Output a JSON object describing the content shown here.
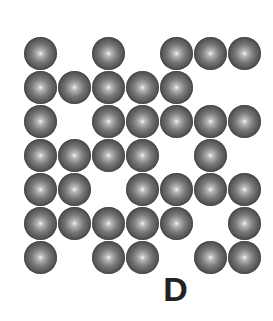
{
  "figure": {
    "label": "D",
    "rows": 7,
    "cols": 7,
    "ball_color": "#4a4a4a",
    "grid": [
      [
        1,
        0,
        1,
        0,
        1,
        1,
        1
      ],
      [
        1,
        1,
        1,
        1,
        1,
        0,
        0
      ],
      [
        1,
        0,
        1,
        1,
        1,
        1,
        1
      ],
      [
        1,
        1,
        1,
        1,
        0,
        1,
        0
      ],
      [
        1,
        1,
        0,
        1,
        1,
        1,
        1
      ],
      [
        1,
        1,
        1,
        1,
        1,
        0,
        1
      ],
      [
        1,
        0,
        1,
        1,
        0,
        1,
        1
      ]
    ]
  }
}
